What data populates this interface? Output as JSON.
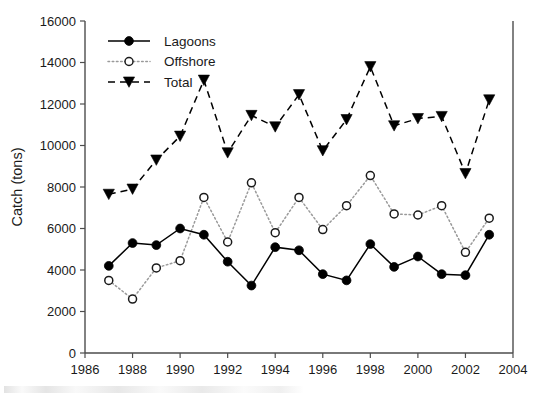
{
  "chart_data": {
    "type": "line",
    "title": "",
    "xlabel": "",
    "ylabel": "Catch (tons)",
    "xlim": [
      1986,
      2004
    ],
    "ylim": [
      0,
      16000
    ],
    "xticks": [
      1986,
      1988,
      1990,
      1992,
      1994,
      1996,
      1998,
      2000,
      2002,
      2004
    ],
    "yticks": [
      0,
      2000,
      4000,
      6000,
      8000,
      10000,
      12000,
      14000,
      16000
    ],
    "grid": false,
    "legend_position": "top-left inside axes",
    "x": [
      1987,
      1988,
      1989,
      1990,
      1991,
      1992,
      1993,
      1994,
      1995,
      1996,
      1997,
      1998,
      1999,
      2000,
      2001,
      2002,
      2003
    ],
    "series": [
      {
        "name": "Lagoons",
        "marker": "filled-circle",
        "line_style": "solid",
        "color": "#000000",
        "values": [
          4200,
          5300,
          5200,
          6000,
          5700,
          4400,
          3250,
          5100,
          4950,
          3800,
          3500,
          5250,
          4150,
          4650,
          3800,
          3750,
          5700
        ]
      },
      {
        "name": "Offshore",
        "marker": "open-circle",
        "line_style": "dotted",
        "color": "#9a9a9a",
        "values": [
          3500,
          2600,
          4100,
          4450,
          7500,
          5350,
          8200,
          5800,
          7500,
          5950,
          7100,
          8550,
          6700,
          6650,
          7100,
          4850,
          6500
        ]
      },
      {
        "name": "Total",
        "marker": "filled-triangle-down",
        "line_style": "dashed",
        "color": "#000000",
        "values": [
          7650,
          7900,
          9300,
          10450,
          13150,
          9650,
          11450,
          10900,
          12450,
          9750,
          11250,
          13800,
          10950,
          11300,
          11400,
          8650,
          12200
        ]
      }
    ]
  },
  "axes": {
    "y_axis_title": "Catch (tons)",
    "y_tick_labels": [
      "0",
      "2000",
      "4000",
      "6000",
      "8000",
      "10000",
      "12000",
      "14000",
      "16000"
    ],
    "x_tick_labels": [
      "1986",
      "1988",
      "1990",
      "1992",
      "1994",
      "1996",
      "1998",
      "2000",
      "2002",
      "2004"
    ]
  },
  "legend": {
    "entries": [
      {
        "label": "Lagoons",
        "icon": "filled-circle-solid-line-icon"
      },
      {
        "label": "Offshore",
        "icon": "open-circle-dotted-line-icon"
      },
      {
        "label": "Total",
        "icon": "filled-triangle-dashed-line-icon"
      }
    ]
  }
}
